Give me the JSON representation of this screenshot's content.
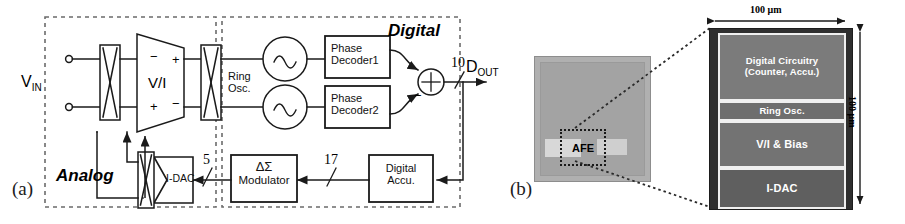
{
  "figure": {
    "panel_a_caption": "(a)",
    "panel_b_caption": "(b)"
  },
  "panel_a": {
    "domains": {
      "analog_label": "Analog",
      "digital_label": "Digital"
    },
    "signals": {
      "input_label": "V",
      "input_sub": "IN",
      "output_label": "D",
      "output_sub": "OUT"
    },
    "blocks": {
      "vi_amp": "V/I",
      "ring_osc": "Ring\nOsc.",
      "ring_osc_line1": "Ring",
      "ring_osc_line2": "Osc.",
      "phase_decoder1_line1": "Phase",
      "phase_decoder1_line2": "Decoder1",
      "phase_decoder2_line1": "Phase",
      "phase_decoder2_line2": "Decoder2",
      "idac": "I-DAC",
      "modulator_line1": "ΔΣ",
      "modulator_line2": "Modulator",
      "accumulator_line1": "Digital",
      "accumulator_line2": "Accu."
    },
    "bus_widths": {
      "summer_output": "10",
      "modulator_output": "5",
      "accumulator_output": "17"
    },
    "polarity": {
      "amp_in_minus": "−",
      "amp_in_plus": "+",
      "amp_out_plus": "+",
      "amp_out_minus": "−",
      "summer_plus": "+",
      "summer_minus": "−"
    }
  },
  "panel_b": {
    "die_marker": "AFE",
    "dimensions": {
      "width": "100 μm",
      "height": "100 μm"
    },
    "blocks": [
      {
        "label_line1": "Digital Circuitry",
        "label_line2": "(Counter, Accu.)"
      },
      {
        "label_line1": "Ring Osc.",
        "label_line2": ""
      },
      {
        "label_line1": "V/I & Bias",
        "label_line2": ""
      },
      {
        "label_line1": "I-DAC",
        "label_line2": ""
      }
    ]
  },
  "colors": {
    "line": "#1a1a1a",
    "dashed": "#6b6b6b",
    "die_body": "#a9a9a9",
    "die_dark": "#4a4a4a",
    "background": "#ffffff"
  }
}
